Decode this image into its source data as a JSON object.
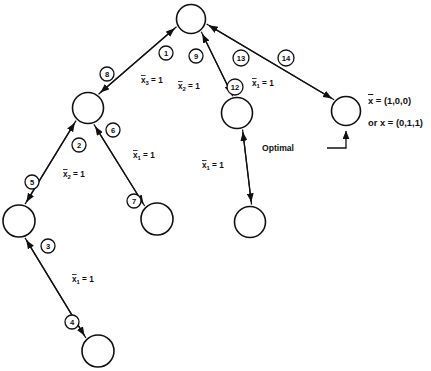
{
  "figure": {
    "background_color": "#ffffff",
    "ink_color": "#101010"
  },
  "nodes": [
    {
      "id": "root",
      "name": "node-root",
      "cx": 191,
      "cy": 19,
      "r": 14.5
    },
    {
      "id": "n2",
      "name": "node-left-upper",
      "cx": 88,
      "cy": 108,
      "r": 15.5
    },
    {
      "id": "n3",
      "name": "node-left-lower",
      "cx": 19,
      "cy": 221,
      "r": 16.0
    },
    {
      "id": "n4",
      "name": "node-left-bottom",
      "cx": 98,
      "cy": 351,
      "r": 16.0
    },
    {
      "id": "n7",
      "name": "node-left-right",
      "cx": 157,
      "cy": 219,
      "r": 16.0
    },
    {
      "id": "n12",
      "name": "node-mid-upper",
      "cx": 237,
      "cy": 113,
      "r": 15.5
    },
    {
      "id": "n11",
      "name": "node-mid-lower",
      "cx": 250,
      "cy": 222,
      "r": 15.5
    },
    {
      "id": "n14",
      "name": "node-optimal",
      "cx": 346,
      "cy": 111,
      "r": 14.5
    }
  ],
  "edges": [
    {
      "badge": "1",
      "name": "edge-1",
      "from": "root",
      "to": "n2",
      "direction": "down",
      "side": "right"
    },
    {
      "badge": "8",
      "name": "edge-8",
      "from": "n2",
      "to": "root",
      "direction": "up",
      "side": "left"
    },
    {
      "badge": "2",
      "name": "edge-2",
      "from": "n2",
      "to": "n3",
      "direction": "down",
      "side": "right"
    },
    {
      "badge": "5",
      "name": "edge-5",
      "from": "n3",
      "to": "n2",
      "direction": "up",
      "side": "left"
    },
    {
      "badge": "3",
      "name": "edge-3",
      "from": "n3",
      "to": "n4",
      "direction": "down",
      "side": "right"
    },
    {
      "badge": "4",
      "name": "edge-4",
      "from": "n4",
      "to": "n3",
      "direction": "up",
      "side": "left"
    },
    {
      "badge": "6",
      "name": "edge-6",
      "from": "n2",
      "to": "n7",
      "direction": "down",
      "side": "right"
    },
    {
      "badge": "7",
      "name": "edge-7",
      "from": "n7",
      "to": "n2",
      "direction": "up",
      "side": "left"
    },
    {
      "badge": "9",
      "name": "edge-9",
      "from": "root",
      "to": "n12",
      "direction": "down",
      "side": "left"
    },
    {
      "badge": "12",
      "name": "edge-12",
      "from": "n12",
      "to": "root",
      "direction": "up",
      "side": "right"
    },
    {
      "badge": "10",
      "name": "edge-10",
      "from": "n12",
      "to": "n11",
      "direction": "down",
      "side": "left"
    },
    {
      "badge": "11",
      "name": "edge-11",
      "from": "n11",
      "to": "n12",
      "direction": "up",
      "side": "right"
    },
    {
      "badge": "13",
      "name": "edge-13",
      "from": "root",
      "to": "n14",
      "direction": "down",
      "side": "left"
    },
    {
      "badge": "14",
      "name": "edge-14",
      "from": "n14",
      "to": "root",
      "direction": "up",
      "side": "right"
    }
  ],
  "badge_positions": [
    {
      "badge": "1",
      "x": 166,
      "y": 53
    },
    {
      "badge": "8",
      "x": 107,
      "y": 74
    },
    {
      "badge": "2",
      "x": 79,
      "y": 145
    },
    {
      "badge": "5",
      "x": 32,
      "y": 182
    },
    {
      "badge": "3",
      "x": 48,
      "y": 246
    },
    {
      "badge": "4",
      "x": 72,
      "y": 322
    },
    {
      "badge": "6",
      "x": 113,
      "y": 130
    },
    {
      "badge": "7",
      "x": 134,
      "y": 201
    },
    {
      "badge": "9",
      "x": 196,
      "y": 56
    },
    {
      "badge": "12",
      "x": 235,
      "y": 87
    },
    {
      "badge": "13",
      "x": 241,
      "y": 58
    },
    {
      "badge": "14",
      "x": 286,
      "y": 58
    }
  ],
  "variable_labels": [
    {
      "id": "lbl1",
      "name": "label-x3-eq-1",
      "var": "x",
      "sub": "3",
      "text": " = 1",
      "x": 141,
      "y": 80,
      "anchor": "start"
    },
    {
      "id": "lbl2",
      "name": "label-x2-eq-1-left",
      "var": "x",
      "sub": "2",
      "text": " = 1",
      "x": 63,
      "y": 174,
      "anchor": "start"
    },
    {
      "id": "lbl3",
      "name": "label-x1-eq-1-bottom",
      "var": "x",
      "sub": "1",
      "text": " = 1",
      "x": 72,
      "y": 279,
      "anchor": "start"
    },
    {
      "id": "lbl4",
      "name": "label-x1-eq-1-mid",
      "var": "x",
      "sub": "1",
      "text": " = 1",
      "x": 133,
      "y": 155,
      "anchor": "start"
    },
    {
      "id": "lbl5",
      "name": "label-x2-eq-1-mid",
      "var": "x",
      "sub": "2",
      "text": " = 1",
      "x": 178,
      "y": 86,
      "anchor": "start"
    },
    {
      "id": "lbl6",
      "name": "label-x1-eq-1-center",
      "var": "x",
      "sub": "1",
      "text": " = 1",
      "x": 202,
      "y": 165,
      "anchor": "start"
    },
    {
      "id": "lbl7",
      "name": "label-x1-eq-1-right",
      "var": "x",
      "sub": "1",
      "text": " = 1",
      "x": 252,
      "y": 83,
      "anchor": "start"
    }
  ],
  "annotations": {
    "solution_line_1": {
      "name": "optimal-solution-xbar",
      "prefix": "x",
      "text": " = (1,0,0)",
      "x": 368,
      "y": 100
    },
    "solution_line_2": {
      "name": "optimal-solution-x",
      "text": "or  x  =  (0,1,1)",
      "x": 368,
      "y": 122
    },
    "optimal_label": {
      "name": "optimal-callout-label",
      "text": "Optimal",
      "x": 294,
      "y": 148
    }
  }
}
